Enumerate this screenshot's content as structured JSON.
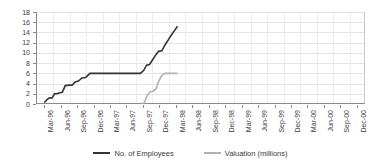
{
  "chart_data": {
    "type": "line",
    "title": "",
    "xlabel": "",
    "ylabel": "",
    "ylim": [
      0,
      18
    ],
    "ytick_step": 2,
    "yticks": [
      "0",
      "2",
      "4",
      "6",
      "8",
      "10",
      "12",
      "14",
      "16",
      "18"
    ],
    "grid": true,
    "legend_position": "bottom",
    "categories": [
      "Mar-96",
      "Jun-96",
      "Sep-96",
      "Dec-96",
      "Mar-97",
      "Jun-97",
      "Sep-97",
      "Dec-97",
      "Mar-98",
      "Jun-98",
      "Sep-98",
      "Dec-98",
      "Mar-99",
      "Jun-99",
      "Sep-99",
      "Dec-99",
      "Mar-00",
      "Jun-00",
      "Sep-00",
      "Dec-00"
    ],
    "series": [
      {
        "name": "No. of Employees",
        "color": "#333333",
        "values": [
          0,
          1,
          2,
          3,
          4,
          5,
          6,
          6,
          9,
          15,
          null,
          null,
          null,
          null,
          null,
          null,
          null,
          null,
          null,
          null
        ]
      },
      {
        "name": "Valuation (millions)",
        "color": "#b0b0b0",
        "values": [
          null,
          null,
          null,
          null,
          null,
          null,
          null,
          0,
          3,
          6,
          null,
          null,
          null,
          null,
          null,
          null,
          null,
          null,
          null,
          null
        ]
      }
    ],
    "series_points": [
      {
        "name": "No. of Employees",
        "color": "#333333",
        "points": [
          [
            0.0,
            0.3
          ],
          [
            0.18,
            0.9
          ],
          [
            0.33,
            1.2
          ],
          [
            0.48,
            1.2
          ],
          [
            0.62,
            2.0
          ],
          [
            0.78,
            2.0
          ],
          [
            0.95,
            2.2
          ],
          [
            1.1,
            2.3
          ],
          [
            1.28,
            3.6
          ],
          [
            1.52,
            3.7
          ],
          [
            1.7,
            3.7
          ],
          [
            1.88,
            4.3
          ],
          [
            2.08,
            4.5
          ],
          [
            2.3,
            5.1
          ],
          [
            2.52,
            5.2
          ],
          [
            2.78,
            6.0
          ],
          [
            3.05,
            6.0
          ],
          [
            4.0,
            6.0
          ],
          [
            5.0,
            6.0
          ],
          [
            5.85,
            6.0
          ],
          [
            6.05,
            6.6
          ],
          [
            6.22,
            7.6
          ],
          [
            6.4,
            7.7
          ],
          [
            6.58,
            8.6
          ],
          [
            6.78,
            9.6
          ],
          [
            6.95,
            10.3
          ],
          [
            7.15,
            10.4
          ],
          [
            7.35,
            11.6
          ],
          [
            7.55,
            12.6
          ],
          [
            7.75,
            13.6
          ],
          [
            7.95,
            14.5
          ],
          [
            8.1,
            15.2
          ]
        ]
      },
      {
        "name": "Valuation (millions)",
        "color": "#b0b0b0",
        "points": [
          [
            5.9,
            0.1
          ],
          [
            6.08,
            0.2
          ],
          [
            6.25,
            1.6
          ],
          [
            6.45,
            2.4
          ],
          [
            6.62,
            2.5
          ],
          [
            6.8,
            3.0
          ],
          [
            6.95,
            4.4
          ],
          [
            7.15,
            5.6
          ],
          [
            7.35,
            6.0
          ],
          [
            7.6,
            6.0
          ],
          [
            8.1,
            6.0
          ]
        ]
      }
    ]
  },
  "legend": {
    "items": [
      {
        "label": "No. of Employees",
        "marker": "dark"
      },
      {
        "label": "Valuation (millions)",
        "marker": "light"
      }
    ]
  }
}
